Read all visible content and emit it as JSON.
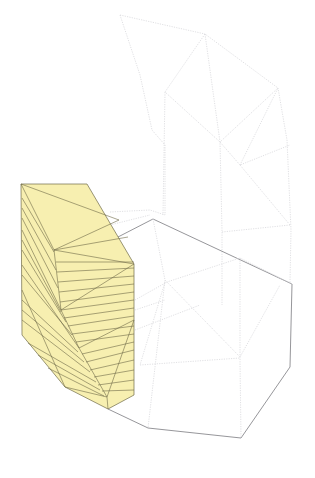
{
  "diagram": {
    "type": "triangulated-mesh-wireframe",
    "colors": {
      "background": "#ffffff",
      "highlight_fill": "#f7efb0",
      "highlight_stroke": "#6f6a48",
      "ghost_stroke": "#d8d8dc",
      "outline_stroke": "#8a8a8e"
    },
    "regions": [
      {
        "name": "highlighted-yellow-block",
        "description": "Yellow-filled triangulated prism on the left"
      },
      {
        "name": "ghost-upper-shell",
        "description": "Dotted light-grey triangulated curved shell above"
      },
      {
        "name": "lower-hexagonal-outline",
        "description": "Solid grey hexagonal base outline with dotted triangulation"
      }
    ],
    "labels": []
  }
}
